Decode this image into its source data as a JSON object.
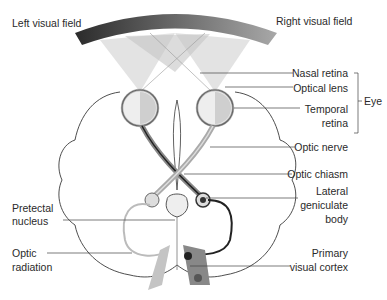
{
  "diagram": {
    "fields": {
      "left": "Left visual field",
      "right": "Right visual field"
    },
    "labels": {
      "nasal_retina": "Nasal retina",
      "optical_lens": "Optical lens",
      "temporal_retina_1": "Temporal",
      "temporal_retina_2": "retina",
      "eye": "Eye",
      "optic_nerve": "Optic nerve",
      "optic_chiasm": "Optic chiasm",
      "lgb_1": "Lateral",
      "lgb_2": "geniculate",
      "lgb_3": "body",
      "pretectal_1": "Pretectal",
      "pretectal_2": "nucleus",
      "optic_rad_1": "Optic",
      "optic_rad_2": "radiation",
      "pvc_1": "Primary",
      "pvc_2": "visual cortex"
    },
    "colors": {
      "field_dark": "#2b2b2b",
      "field_light": "#9a9a9a",
      "outline": "#3a3a3a",
      "cortex_left": "#b5b5b5",
      "cortex_right": "#6e6e6e"
    }
  }
}
